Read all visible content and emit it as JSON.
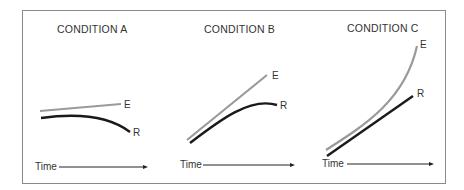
{
  "figure": {
    "panels": [
      {
        "title": "CONDITION A",
        "x_label": "Time",
        "series": [
          {
            "name": "E",
            "label": "E",
            "color": "#9a9a9a",
            "description": "slowly rising straight line"
          },
          {
            "name": "R",
            "label": "R",
            "color": "#1a1a1a",
            "description": "flat then curving downward"
          }
        ]
      },
      {
        "title": "CONDITION B",
        "x_label": "Time",
        "series": [
          {
            "name": "E",
            "label": "E",
            "color": "#9a9a9a",
            "description": "steadily rising straight line"
          },
          {
            "name": "R",
            "label": "R",
            "color": "#1a1a1a",
            "description": "rising then leveling off"
          }
        ]
      },
      {
        "title": "CONDITION C",
        "x_label": "Time",
        "series": [
          {
            "name": "E",
            "label": "E",
            "color": "#9a9a9a",
            "description": "accelerating upward curve"
          },
          {
            "name": "R",
            "label": "R",
            "color": "#1a1a1a",
            "description": "steadily rising straight line"
          }
        ]
      }
    ]
  }
}
